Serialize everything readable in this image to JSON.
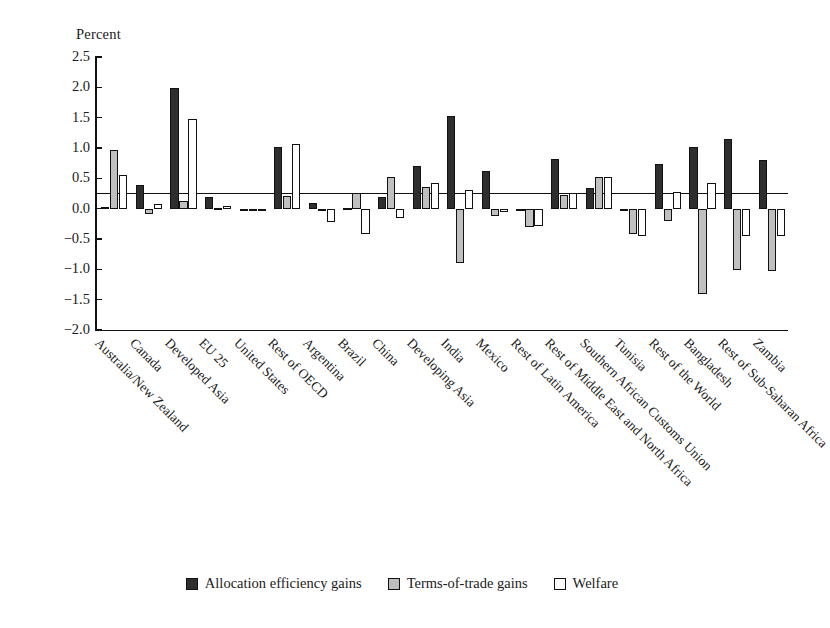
{
  "chart_data": {
    "type": "bar",
    "title": "",
    "xlabel": "",
    "ylabel": "Percent",
    "ylim": [
      -2.0,
      2.5
    ],
    "ytick_labels": [
      "2.5",
      "2.0",
      "1.5",
      "1.0",
      "0.5",
      "0.0",
      "-0.5",
      "-1.0",
      "-1.5",
      "-2.0"
    ],
    "ytick_values": [
      2.5,
      2.0,
      1.5,
      1.0,
      0.5,
      0.0,
      -0.5,
      -1.0,
      -1.5,
      -2.0
    ],
    "grid": false,
    "legend_position": "bottom",
    "categories": [
      "Australia/New Zealand",
      "Canada",
      "Developed Asia",
      "EU 25",
      "United States",
      "Rest of OECD",
      "Argentina",
      "Brazil",
      "China",
      "Developing Asia",
      "India",
      "Mexico",
      "Rest of Latin America",
      "Rest of Middle East and North Africa",
      "Southern African Customs Union",
      "Tunisia",
      "Rest of the World",
      "Bangladesh",
      "Rest of Sub-Saharan Africa",
      "Zambia"
    ],
    "series": [
      {
        "name": "Allocation efficiency gains",
        "color": "#2e2e2e",
        "values": [
          0.02,
          0.39,
          1.99,
          0.19,
          -0.03,
          1.01,
          0.1,
          0.01,
          0.19,
          0.7,
          1.52,
          0.62,
          0.0,
          0.82,
          0.34,
          0.0,
          0.73,
          1.02,
          1.15,
          0.81
        ]
      },
      {
        "name": "Terms-of-trade gains",
        "color": "#c0c0c0",
        "values": [
          0.97,
          -0.08,
          0.13,
          0.01,
          -0.02,
          0.21,
          0.0,
          0.26,
          0.52,
          0.36,
          -0.9,
          -0.12,
          -0.31,
          0.23,
          0.52,
          -0.41,
          -0.21,
          -1.4,
          -1.01,
          -1.02
        ]
      },
      {
        "name": "Welfare",
        "color": "#ffffff",
        "values": [
          0.55,
          0.08,
          1.47,
          0.04,
          -0.02,
          1.07,
          -0.22,
          -0.41,
          -0.16,
          0.43,
          0.3,
          -0.05,
          -0.28,
          0.26,
          0.53,
          -0.45,
          0.27,
          0.42,
          -0.45,
          -0.45
        ]
      }
    ]
  },
  "legend": {
    "items": [
      {
        "label": "Allocation efficiency gains",
        "swatch": "dark"
      },
      {
        "label": "Terms-of-trade gains",
        "swatch": "gray"
      },
      {
        "label": "Welfare",
        "swatch": "white"
      }
    ]
  }
}
